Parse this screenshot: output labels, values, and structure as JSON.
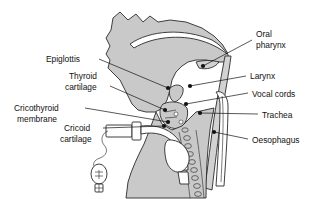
{
  "diagram": {
    "colors": {
      "organ_fill": "#c9c9c9",
      "outline": "#2a2a2a",
      "text": "#111111",
      "background": "#ffffff"
    },
    "labels": [
      {
        "id": "epiglottis",
        "text": "Epiglottis",
        "side": "left",
        "x": 46,
        "y": 62,
        "align": "start"
      },
      {
        "id": "thyroid-cartilage",
        "line1": "Thyroid",
        "line2": "cartilage",
        "side": "left",
        "x": 64,
        "y": 78,
        "align": "start"
      },
      {
        "id": "cricothyroid-membrane",
        "line1": "Cricothyroid",
        "line2": "membrane",
        "side": "left",
        "x": 12,
        "y": 110,
        "align": "start"
      },
      {
        "id": "cricoid-cartilage",
        "line1": "Cricoid",
        "line2": "cartilage",
        "side": "left",
        "x": 61,
        "y": 130,
        "align": "start"
      },
      {
        "id": "oral-pharynx",
        "line1": "Oral",
        "line2": "pharynx",
        "side": "right",
        "x": 256,
        "y": 34,
        "align": "start"
      },
      {
        "id": "larynx",
        "text": "Oral-larynx-placeholder",
        "side": "right",
        "x": 250,
        "y": 78,
        "align": "start"
      },
      {
        "id": "vocal-cords",
        "text": "Vocal cords",
        "side": "right",
        "x": 252,
        "y": 96,
        "align": "start"
      },
      {
        "id": "trachea",
        "text": "Trachea",
        "side": "right",
        "x": 262,
        "y": 117,
        "align": "start"
      },
      {
        "id": "oesophagus",
        "text": "Oesophagus",
        "side": "right",
        "x": 252,
        "y": 142,
        "align": "start"
      }
    ],
    "label_text": {
      "epiglottis": "Epiglottis",
      "thyroid_1": "Thyroid",
      "thyroid_2": "cartilage",
      "cricothyroid_1": "Cricothyroid",
      "cricothyroid_2": "membrane",
      "cricoid_1": "Cricoid",
      "cricoid_2": "cartilage",
      "oral_1": "Oral",
      "oral_2": "pharynx",
      "larynx": "Larynx",
      "vocal_cords": "Vocal cords",
      "trachea": "Trachea",
      "oesophagus": "Oesophagus"
    },
    "structures": [
      "tongue",
      "hard-palate",
      "soft-palate",
      "epiglottis",
      "thyroid-cartilage",
      "cricoid-cartilage",
      "vocal-cords",
      "trachea",
      "oesophagus",
      "tracheostomy-tube",
      "pilot-balloon",
      "neck-outline",
      "chest-outline"
    ]
  }
}
